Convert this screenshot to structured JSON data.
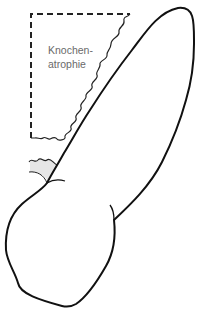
{
  "diagram": {
    "annotation": {
      "line1": "Knochen-",
      "line2": "atrophie"
    },
    "colors": {
      "outline": "#111111",
      "dashed_region": "#222222",
      "label": "#6a6a6a",
      "shaded_area": "#e6e6e6"
    }
  }
}
